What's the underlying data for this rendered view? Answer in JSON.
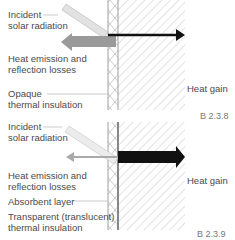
{
  "figures": [
    {
      "id": "B 2.3.8",
      "labels": {
        "incident_1": "Incident",
        "incident_2": "solar radiation",
        "emission_1": "Heat emission and",
        "emission_2": "reflection losses",
        "insulation_1": "Opaque",
        "insulation_2": "thermal insulation",
        "gain": "Heat gain"
      },
      "caption": "B 2.3.8"
    },
    {
      "id": "B 2.3.9",
      "labels": {
        "incident_1": "Incident",
        "incident_2": "solar radiation",
        "emission_1": "Heat emission and",
        "emission_2": "reflection losses",
        "absorbent": "Absorbent layer",
        "insulation_1": "Transparent (translucent)",
        "insulation_2": "thermal insulation",
        "gain": "Heat gain"
      },
      "caption": "B 2.3.9"
    }
  ],
  "colors": {
    "arrow_dark": "#111111",
    "arrow_gray": "#999999",
    "arrow_light": "#bdbdbd",
    "incident_fill": "#e2e2e2",
    "hatch": "#b5b5b5"
  }
}
